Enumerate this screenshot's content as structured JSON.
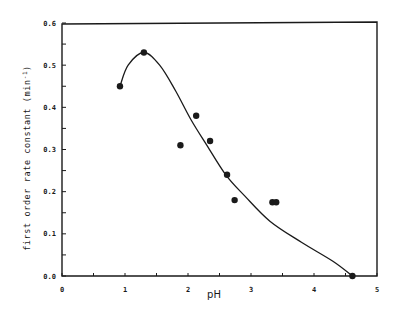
{
  "chart_data": {
    "type": "scatter",
    "title": "",
    "xlabel": "pH",
    "ylabel": "first order rate constant (min-1)",
    "xlim": [
      0,
      5
    ],
    "ylim": [
      0.0,
      0.6
    ],
    "grid": false,
    "legend": null,
    "x_ticks": [
      {
        "value": 0,
        "label": "0"
      },
      {
        "value": 1,
        "label": "1"
      },
      {
        "value": 2,
        "label": "2"
      },
      {
        "value": 3,
        "label": "3"
      },
      {
        "value": 4,
        "label": "4"
      },
      {
        "value": 5,
        "label": "5"
      }
    ],
    "x_minor_ticks": [
      0.5,
      1.5,
      2.5,
      3.5,
      4.5
    ],
    "y_ticks": [
      {
        "value": 0.0,
        "label": "0.0"
      },
      {
        "value": 0.1,
        "label": "0.1"
      },
      {
        "value": 0.2,
        "label": "0.2"
      },
      {
        "value": 0.3,
        "label": "0.3"
      },
      {
        "value": 0.4,
        "label": "0.4"
      },
      {
        "value": 0.5,
        "label": "0.5"
      },
      {
        "value": 0.6,
        "label": "0.6"
      }
    ],
    "y_minor_ticks": [
      0.05,
      0.15,
      0.25,
      0.35,
      0.45,
      0.55
    ],
    "series": [
      {
        "name": "measured",
        "type": "scatter",
        "color": "#1a1a1a",
        "points": [
          {
            "x": 0.92,
            "y": 0.45
          },
          {
            "x": 1.3,
            "y": 0.53
          },
          {
            "x": 1.88,
            "y": 0.31
          },
          {
            "x": 2.13,
            "y": 0.38
          },
          {
            "x": 2.35,
            "y": 0.32
          },
          {
            "x": 2.62,
            "y": 0.24
          },
          {
            "x": 2.74,
            "y": 0.18
          },
          {
            "x": 3.34,
            "y": 0.175
          },
          {
            "x": 3.4,
            "y": 0.175
          },
          {
            "x": 4.61,
            "y": 0.0
          }
        ]
      },
      {
        "name": "fitted curve",
        "type": "line",
        "color": "#1a1a1a",
        "points": [
          {
            "x": 0.92,
            "y": 0.45
          },
          {
            "x": 1.05,
            "y": 0.5
          },
          {
            "x": 1.3,
            "y": 0.53
          },
          {
            "x": 1.55,
            "y": 0.5
          },
          {
            "x": 1.8,
            "y": 0.44
          },
          {
            "x": 2.05,
            "y": 0.37
          },
          {
            "x": 2.3,
            "y": 0.31
          },
          {
            "x": 2.6,
            "y": 0.24
          },
          {
            "x": 2.9,
            "y": 0.19
          },
          {
            "x": 3.3,
            "y": 0.13
          },
          {
            "x": 3.8,
            "y": 0.08
          },
          {
            "x": 4.3,
            "y": 0.035
          },
          {
            "x": 4.61,
            "y": 0.0
          }
        ]
      }
    ]
  },
  "labels": {
    "x_axis": "pH",
    "y_axis": "first order rate constant (min",
    "y_axis_sup": "-1",
    "y_axis_close": ")"
  }
}
